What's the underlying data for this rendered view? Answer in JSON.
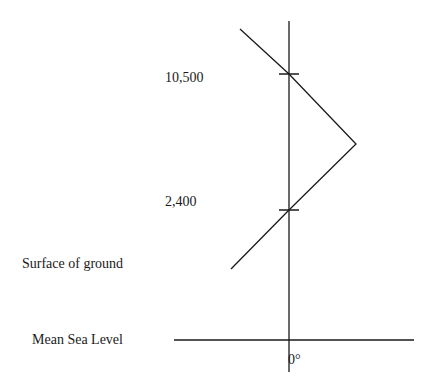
{
  "diagram": {
    "labels": {
      "alt_high": "10,500",
      "alt_low": "2,400",
      "surface": "Surface of ground",
      "msl": "Mean Sea Level",
      "zero_temp": "0°"
    },
    "line_color": "#1a1a1a",
    "temperature_profile": [
      {
        "x": 240,
        "y": 29
      },
      {
        "x": 289,
        "y": 74
      },
      {
        "x": 356,
        "y": 144
      },
      {
        "x": 289,
        "y": 210
      },
      {
        "x": 231,
        "y": 269
      }
    ]
  }
}
